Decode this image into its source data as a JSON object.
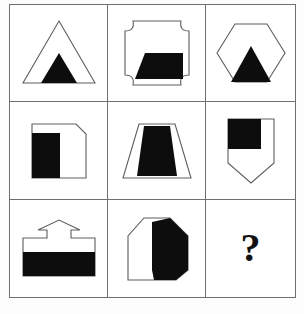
{
  "puzzle": {
    "type": "matrix-reasoning-3x3",
    "title": "",
    "rows": 3,
    "columns": 3,
    "colors": {
      "fill_black": "#0d0d0d",
      "outline": "#5e5e5f",
      "grid_line": "#6f6f70",
      "background": "#ffffff"
    },
    "cells": [
      {
        "index": 1,
        "row": 1,
        "column": 1,
        "shape_name": "triangle",
        "shape_label": "outlined triangle",
        "inner_name": "filled-triangle",
        "inner_label": "small black triangle at bottom center",
        "shaded_fraction": "small",
        "is_answer_slot": false,
        "content_text": ""
      },
      {
        "index": 2,
        "row": 1,
        "column": 2,
        "shape_name": "concave-corner-square",
        "shape_label": "square with concave cut corners",
        "inner_name": "filled-parallelogram",
        "inner_label": "black parallelogram at bottom",
        "shaded_fraction": "small",
        "is_answer_slot": false,
        "content_text": ""
      },
      {
        "index": 3,
        "row": 1,
        "column": 3,
        "shape_name": "hexagon",
        "shape_label": "outlined hexagon",
        "inner_name": "filled-triangle",
        "inner_label": "black triangle at bottom center",
        "shaded_fraction": "medium",
        "is_answer_slot": false,
        "content_text": ""
      },
      {
        "index": 4,
        "row": 2,
        "column": 1,
        "shape_name": "clipped-corner-square",
        "shape_label": "square with chamfered top-right corner",
        "inner_name": "filled-left-block",
        "inner_label": "black block filling left portion",
        "shaded_fraction": "half",
        "is_answer_slot": false,
        "content_text": ""
      },
      {
        "index": 5,
        "row": 2,
        "column": 2,
        "shape_name": "trapezoid",
        "shape_label": "outlined trapezoid",
        "inner_name": "filled-inner-trapezoid",
        "inner_label": "black inner trapezoid with white side margins",
        "shaded_fraction": "large",
        "is_answer_slot": false,
        "content_text": ""
      },
      {
        "index": 6,
        "row": 2,
        "column": 3,
        "shape_name": "shield-pentagon",
        "shape_label": "shield shape with pointed bottom",
        "inner_name": "filled-upper-left-square",
        "inner_label": "black square in upper-left",
        "shaded_fraction": "medium",
        "is_answer_slot": false,
        "content_text": ""
      },
      {
        "index": 7,
        "row": 3,
        "column": 1,
        "shape_name": "up-arrow-block",
        "shape_label": "wide block with upward arrow on top",
        "inner_name": "filled-bottom-band",
        "inner_label": "black band filling lower half",
        "shaded_fraction": "half",
        "is_answer_slot": false,
        "content_text": ""
      },
      {
        "index": 8,
        "row": 3,
        "column": 2,
        "shape_name": "house-octagon",
        "shape_label": "octagon with chamfered corners",
        "inner_name": "filled-right-region",
        "inner_label": "black region on the right with diagonal lower edge",
        "shaded_fraction": "large",
        "is_answer_slot": false,
        "content_text": ""
      },
      {
        "index": 9,
        "row": 3,
        "column": 3,
        "shape_name": "question-mark",
        "shape_label": "missing answer",
        "inner_name": "",
        "inner_label": "",
        "shaded_fraction": "",
        "is_answer_slot": true,
        "content_text": "?"
      }
    ]
  }
}
